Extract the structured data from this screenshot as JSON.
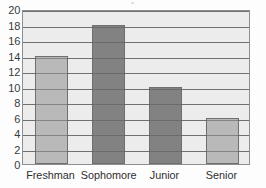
{
  "chart_data": {
    "type": "bar",
    "title": "",
    "subtitle": "",
    "xlabel": "",
    "ylabel": "",
    "categories": [
      "Freshman",
      "Sophomore",
      "Junior",
      "Senior"
    ],
    "values": [
      14,
      18,
      10,
      6
    ],
    "bar_colors": [
      "#b9b9b9",
      "#828282",
      "#828282",
      "#b9b9b9"
    ],
    "ylim": [
      0,
      20
    ],
    "ytick_step": 2,
    "ytick_labels": [
      "20",
      "18",
      "16",
      "14",
      "12",
      "10",
      "8",
      "6",
      "4",
      "2",
      "0"
    ],
    "ytick_values": [
      20,
      18,
      16,
      14,
      12,
      10,
      8,
      6,
      4,
      2,
      0
    ],
    "grid": true,
    "grid_orientation": "horizontal",
    "legend": false,
    "legend_position": "none",
    "plot_background": "#ececec",
    "grid_color": "#8d8d8d",
    "axis_color": "#8e8e8e",
    "bar_border_color": "#6f6f6f"
  }
}
